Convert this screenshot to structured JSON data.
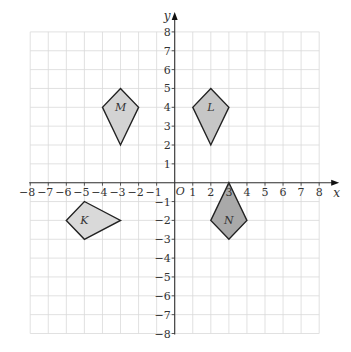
{
  "diagram": {
    "type": "coordinate-grid",
    "x_axis": {
      "label": "x",
      "min": -8,
      "max": 8,
      "ticks": [
        "-8",
        "-7",
        "-6",
        "-5",
        "-4",
        "-3",
        "-2",
        "-1",
        "1",
        "2",
        "3",
        "4",
        "5",
        "6",
        "7",
        "8"
      ]
    },
    "y_axis": {
      "label": "y",
      "min": -8,
      "max": 8,
      "ticks": [
        "8",
        "7",
        "6",
        "5",
        "4",
        "3",
        "2",
        "1",
        "-1",
        "-2",
        "-3",
        "-4",
        "-5",
        "-6",
        "-7",
        "-8"
      ]
    },
    "origin_label": "O",
    "shapes": [
      {
        "label": "M",
        "vertices": [
          [
            -3,
            5
          ],
          [
            -2,
            4
          ],
          [
            -3,
            2
          ],
          [
            -4,
            4
          ]
        ],
        "fill": "#d3d3d3"
      },
      {
        "label": "L",
        "vertices": [
          [
            2,
            5
          ],
          [
            3,
            4
          ],
          [
            2,
            2
          ],
          [
            1,
            4
          ]
        ],
        "fill": "#c6c6c6"
      },
      {
        "label": "K",
        "vertices": [
          [
            -5,
            -1
          ],
          [
            -3,
            -2
          ],
          [
            -5,
            -3
          ],
          [
            -6,
            -2
          ]
        ],
        "fill": "#d9d9d9"
      },
      {
        "label": "N",
        "vertices": [
          [
            3,
            0
          ],
          [
            4,
            -2
          ],
          [
            3,
            -3
          ],
          [
            2,
            -2
          ]
        ],
        "fill": "#a9a9a9"
      }
    ],
    "colors": {
      "grid": "#d9d9d9",
      "axis": "#333333",
      "outline": "#222222"
    }
  }
}
